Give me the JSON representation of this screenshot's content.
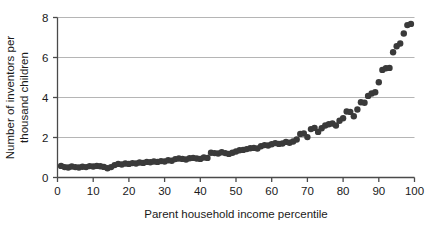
{
  "chart_data": {
    "type": "scatter",
    "title": "",
    "xlabel": "Parent household income percentile",
    "ylabel": "Number of inventors per thousand children",
    "ylabel_lines": [
      "Number of inventors per",
      "thousand children"
    ],
    "xlim": [
      0,
      100
    ],
    "ylim": [
      0,
      8
    ],
    "xticks": [
      0,
      10,
      20,
      30,
      40,
      50,
      60,
      70,
      80,
      90,
      100
    ],
    "xticklabels": [
      "0",
      "10",
      "20",
      "30",
      "40",
      "50",
      "60",
      "70",
      "80",
      "90",
      "100"
    ],
    "yticks": [
      0,
      2,
      4,
      6,
      8
    ],
    "yticklabels": [
      "0",
      "2",
      "4",
      "6",
      "8"
    ],
    "grid": "horizontal",
    "grid_color": "#b5b5b5",
    "legend": "none",
    "marker": "circle",
    "marker_color": "#3a3a3a",
    "marker_size": 3.2,
    "x": [
      1,
      2,
      3,
      4,
      5,
      6,
      7,
      8,
      9,
      10,
      11,
      12,
      13,
      14,
      15,
      16,
      17,
      18,
      19,
      20,
      21,
      22,
      23,
      24,
      25,
      26,
      27,
      28,
      29,
      30,
      31,
      32,
      33,
      34,
      35,
      36,
      37,
      38,
      39,
      40,
      41,
      42,
      43,
      44,
      45,
      46,
      47,
      48,
      49,
      50,
      51,
      52,
      53,
      54,
      55,
      56,
      57,
      58,
      59,
      60,
      61,
      62,
      63,
      64,
      65,
      66,
      67,
      68,
      69,
      70,
      71,
      72,
      73,
      74,
      75,
      76,
      77,
      78,
      79,
      80,
      81,
      82,
      83,
      84,
      85,
      86,
      87,
      88,
      89,
      90,
      91,
      92,
      93,
      94,
      95,
      96,
      97,
      98,
      99
    ],
    "y": [
      0.58,
      0.52,
      0.5,
      0.55,
      0.52,
      0.5,
      0.54,
      0.52,
      0.57,
      0.55,
      0.58,
      0.56,
      0.53,
      0.46,
      0.52,
      0.62,
      0.68,
      0.65,
      0.7,
      0.68,
      0.72,
      0.7,
      0.75,
      0.73,
      0.78,
      0.76,
      0.8,
      0.78,
      0.82,
      0.8,
      0.86,
      0.84,
      0.92,
      0.95,
      0.93,
      0.9,
      0.96,
      0.98,
      0.95,
      0.93,
      1.0,
      0.98,
      1.24,
      1.22,
      1.2,
      1.26,
      1.22,
      1.18,
      1.24,
      1.3,
      1.36,
      1.38,
      1.42,
      1.46,
      1.48,
      1.45,
      1.56,
      1.62,
      1.6,
      1.66,
      1.72,
      1.68,
      1.7,
      1.78,
      1.74,
      1.8,
      1.9,
      2.18,
      2.2,
      2.02,
      2.42,
      2.48,
      2.28,
      2.46,
      2.6,
      2.66,
      2.7,
      2.6,
      2.84,
      2.96,
      3.3,
      3.28,
      3.06,
      3.4,
      3.76,
      3.74,
      4.08,
      4.2,
      4.26,
      4.76,
      5.38,
      5.46,
      5.48,
      6.26,
      6.56,
      6.7,
      7.2,
      7.62,
      7.68
    ]
  }
}
